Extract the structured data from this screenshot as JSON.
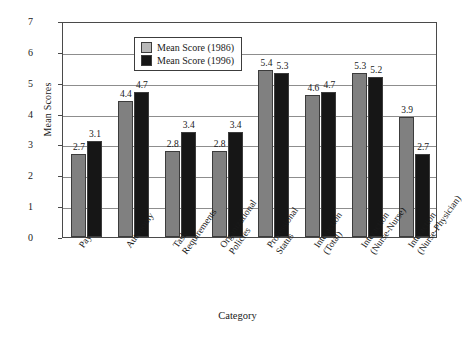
{
  "chart_data": {
    "type": "bar",
    "title": "",
    "xlabel": "Category",
    "ylabel": "Mean Scores",
    "ylim": [
      0,
      7
    ],
    "ytick_step": 1,
    "yticks": [
      "7",
      "6",
      "5",
      "4",
      "3",
      "2",
      "1",
      "0"
    ],
    "grid": true,
    "legend_position": "top-center-inside",
    "categories": [
      "Pay",
      "Autonomy",
      "Task Requirements",
      "Organizational Policies",
      "Professional Status",
      "Interaction (Total)",
      "Interaction (Nurse-Nurse)",
      "Interaction (Nurse-Physician)"
    ],
    "category_lines": [
      [
        "Pay",
        ""
      ],
      [
        "Autonomy",
        ""
      ],
      [
        "Task",
        "Requirements"
      ],
      [
        "Organizational",
        "Policies"
      ],
      [
        "Professional",
        "Status"
      ],
      [
        "Interaction",
        "(Total)"
      ],
      [
        "Interaction",
        "(Nurse-Nurse)"
      ],
      [
        "Interaction",
        "(Nurse-Physician)"
      ]
    ],
    "series": [
      {
        "name": "Mean Score (1986)",
        "color": "#808080",
        "values": [
          2.7,
          4.4,
          2.8,
          2.8,
          5.4,
          4.6,
          5.3,
          3.9
        ]
      },
      {
        "name": "Mean Score (1996)",
        "color": "#161616",
        "values": [
          3.1,
          4.7,
          3.4,
          3.4,
          5.3,
          4.7,
          5.2,
          2.7
        ]
      }
    ]
  },
  "legend": {
    "items": [
      {
        "label": "Mean Score (1986)",
        "swatch": "gray"
      },
      {
        "label": "Mean Score (1996)",
        "swatch": "black"
      }
    ]
  }
}
